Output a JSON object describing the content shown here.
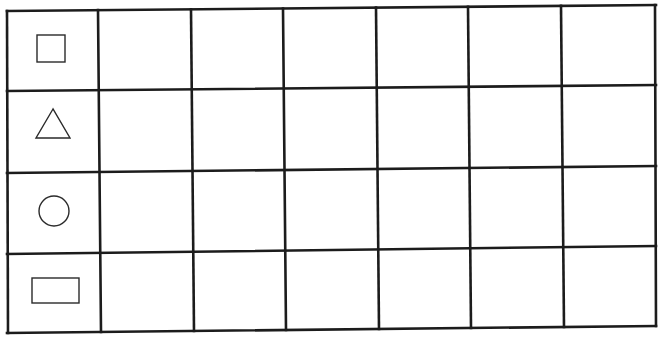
{
  "table": {
    "rows": 4,
    "columns": 7,
    "header_column_shapes": [
      "square",
      "triangle",
      "circle",
      "rectangle"
    ],
    "cells": [
      [
        "",
        "",
        "",
        "",
        "",
        ""
      ],
      [
        "",
        "",
        "",
        "",
        "",
        ""
      ],
      [
        "",
        "",
        "",
        "",
        "",
        ""
      ],
      [
        "",
        "",
        "",
        "",
        "",
        ""
      ]
    ]
  },
  "colors": {
    "line": "#1c1c1c",
    "shape_outline": "#2a2a2a",
    "background": "#ffffff"
  }
}
